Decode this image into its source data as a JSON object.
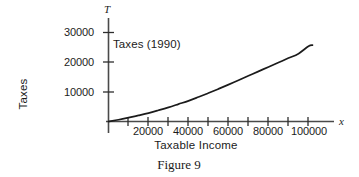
{
  "figure": {
    "caption": "Figure 9",
    "title": "Taxes (1990)"
  },
  "axes": {
    "x_axis_label": "Taxable Income",
    "y_axis_label": "Taxes",
    "x_axis_variable": "x",
    "y_axis_variable": "T",
    "x_tick_labels": [
      "20000",
      "40000",
      "60000",
      "80000",
      "100000"
    ],
    "y_tick_labels": [
      "10000",
      "20000",
      "30000"
    ],
    "line_color": "#1b1b1b",
    "axis_color": "#3c3c3c",
    "background_color": "#ffffff"
  },
  "chart_data": {
    "type": "line",
    "title": "Taxes (1990)",
    "subtitle": "",
    "caption": "Figure 9",
    "xlabel": "Taxable Income",
    "ylabel": "Taxes",
    "x_variable": "x",
    "y_variable": "T",
    "xlim": [
      0,
      113000
    ],
    "ylim": [
      0,
      34000
    ],
    "grid": false,
    "legend": false,
    "x_ticks": [
      0,
      10000,
      20000,
      30000,
      40000,
      50000,
      60000,
      70000,
      80000,
      90000,
      100000,
      110000
    ],
    "x_tick_labels_shown": [
      20000,
      40000,
      60000,
      80000,
      100000
    ],
    "y_ticks": [
      10000,
      20000,
      30000
    ],
    "y_tick_labels_shown": [
      10000,
      20000,
      30000
    ],
    "series": [
      {
        "name": "Taxes (1990)",
        "color": "#1b1b1b",
        "x": [
          0,
          5000,
          10000,
          15000,
          20000,
          25000,
          30000,
          35000,
          40000,
          45000,
          50000,
          55000,
          60000,
          65000,
          70000,
          75000,
          80000,
          85000,
          90000,
          95000,
          100000,
          102000
        ],
        "y": [
          0,
          600,
          1300,
          2050,
          2850,
          3800,
          4800,
          5900,
          7000,
          8300,
          9650,
          11050,
          12500,
          14000,
          15500,
          17000,
          18500,
          20000,
          21500,
          23000,
          25500,
          25900
        ]
      }
    ]
  }
}
